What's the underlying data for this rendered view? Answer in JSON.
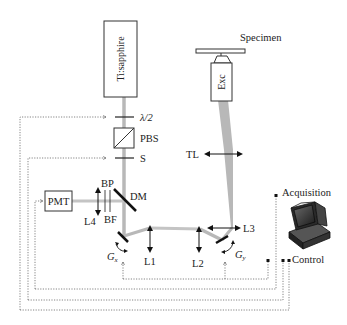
{
  "diagram": {
    "colors": {
      "beam": "#b8b8b8",
      "outline": "#333333",
      "dotted": "#666666",
      "text": "#222222"
    },
    "components": {
      "laser": {
        "label": "Ti:sapphire"
      },
      "half_wave_plate": {
        "label": "λ/2"
      },
      "polarizing_beam_splitter": {
        "label": "PBS"
      },
      "shutter": {
        "label": "S"
      },
      "detector": {
        "label": "PMT"
      },
      "band_pass": {
        "label": "BP"
      },
      "blocking_filter": {
        "label": "BF"
      },
      "dichroic_mirror": {
        "label": "DM"
      },
      "lens_4": {
        "label": "L4"
      },
      "galvo_x": {
        "label": "G",
        "subscript": "x"
      },
      "galvo_y": {
        "label": "G",
        "subscript": "y"
      },
      "lens_1": {
        "label": "L1"
      },
      "lens_2": {
        "label": "L2"
      },
      "lens_3": {
        "label": "L3"
      },
      "tube_lens": {
        "label": "TL"
      },
      "objective": {
        "label": "Exc"
      },
      "specimen": {
        "label": "Specimen"
      },
      "computer": {
        "acquisition_label": "Acquisition",
        "control_label": "Control"
      }
    }
  }
}
